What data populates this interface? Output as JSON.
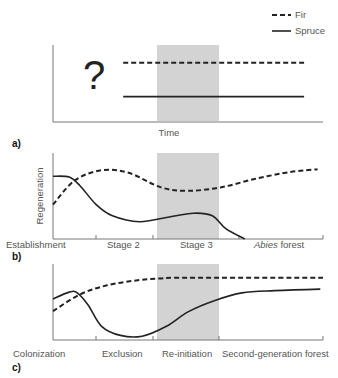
{
  "legend": {
    "fir": "Fir",
    "spruce": "Spruce"
  },
  "panels": [
    {
      "id": "a",
      "label": "a)",
      "question_mark": "?",
      "xlabel": "Time",
      "ylabel": "",
      "stages": [],
      "series": {
        "fir": [
          [
            0.26,
            0.77
          ],
          [
            0.93,
            0.77
          ]
        ],
        "spruce": [
          [
            0.26,
            0.33
          ],
          [
            0.93,
            0.33
          ]
        ]
      }
    },
    {
      "id": "b",
      "label": "b)",
      "xlabel": "",
      "ylabel": "Regeneration",
      "stages": [
        {
          "label": "Establishment",
          "italic": ""
        },
        {
          "label": "Stage 2",
          "italic": ""
        },
        {
          "label": "Stage 3",
          "italic": ""
        },
        {
          "label": " forest",
          "italic": "Abies"
        }
      ],
      "series": {
        "fir": [
          [
            0,
            0.4
          ],
          [
            0.08,
            0.68
          ],
          [
            0.18,
            0.8
          ],
          [
            0.28,
            0.77
          ],
          [
            0.4,
            0.6
          ],
          [
            0.5,
            0.56
          ],
          [
            0.62,
            0.6
          ],
          [
            0.75,
            0.7
          ],
          [
            0.88,
            0.78
          ],
          [
            0.98,
            0.81
          ]
        ],
        "spruce": [
          [
            0,
            0.73
          ],
          [
            0.06,
            0.72
          ],
          [
            0.1,
            0.62
          ],
          [
            0.16,
            0.4
          ],
          [
            0.22,
            0.27
          ],
          [
            0.32,
            0.2
          ],
          [
            0.42,
            0.25
          ],
          [
            0.52,
            0.3
          ],
          [
            0.59,
            0.27
          ],
          [
            0.64,
            0.12
          ],
          [
            0.71,
            0
          ]
        ]
      }
    },
    {
      "id": "c",
      "label": "c)",
      "xlabel": "",
      "ylabel": "",
      "stages": [
        {
          "label": "Colonization",
          "italic": ""
        },
        {
          "label": "Exclusion",
          "italic": ""
        },
        {
          "label": "Re-initiation",
          "italic": ""
        },
        {
          "label": "Second-generation forest",
          "italic": ""
        }
      ],
      "series": {
        "fir": [
          [
            0,
            0.38
          ],
          [
            0.1,
            0.6
          ],
          [
            0.2,
            0.72
          ],
          [
            0.3,
            0.78
          ],
          [
            0.4,
            0.81
          ],
          [
            0.5,
            0.82
          ],
          [
            1.0,
            0.82
          ]
        ],
        "spruce": [
          [
            0,
            0.54
          ],
          [
            0.06,
            0.63
          ],
          [
            0.09,
            0.62
          ],
          [
            0.13,
            0.46
          ],
          [
            0.18,
            0.18
          ],
          [
            0.25,
            0.06
          ],
          [
            0.33,
            0.05
          ],
          [
            0.42,
            0.18
          ],
          [
            0.5,
            0.37
          ],
          [
            0.6,
            0.52
          ],
          [
            0.7,
            0.62
          ],
          [
            0.82,
            0.65
          ],
          [
            0.99,
            0.67
          ]
        ]
      }
    }
  ],
  "shaded_stage": "Stage 3 / Re-initiation"
}
